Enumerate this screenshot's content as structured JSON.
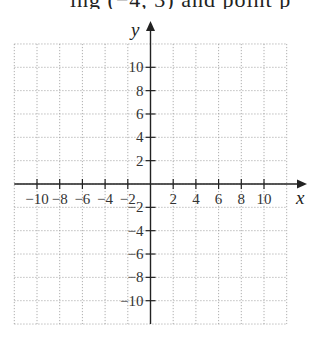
{
  "header": {
    "cropped_text": "ing (−4, 3) and point p"
  },
  "chart_data": {
    "type": "scatter",
    "title": "",
    "xlabel": "x",
    "ylabel": "y",
    "xlim": [
      -12,
      12
    ],
    "ylim": [
      -12,
      12
    ],
    "grid": true,
    "x_ticks": [
      -10,
      -8,
      -6,
      -4,
      -2,
      2,
      4,
      6,
      8,
      10
    ],
    "y_ticks": [
      -10,
      -8,
      -6,
      -4,
      -2,
      2,
      4,
      6,
      8,
      10
    ],
    "x_tick_labels": [
      "−10",
      "−8",
      "−6",
      "−4",
      "−2",
      "2",
      "4",
      "6",
      "8",
      "10"
    ],
    "y_tick_labels": [
      "−10",
      "−8",
      "−6",
      "−4",
      "−2",
      "2",
      "4",
      "6",
      "8",
      "10"
    ],
    "series": []
  }
}
